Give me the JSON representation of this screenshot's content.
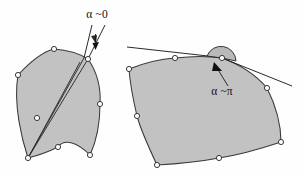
{
  "figure": {
    "background_color": "#fefefe",
    "shape_fill_color": "#c2c2c2",
    "shape_stroke_color": "#3a3a3a",
    "vertex_fill_color": "#fbfbfb",
    "vertex_stroke_color": "#313131",
    "line_color": "#1d1d1d"
  },
  "panels": [
    {
      "id": "left-panel",
      "name": "narrow-angle-region",
      "label": {
        "text": "α ~0",
        "symbol": "alpha",
        "relation": "~",
        "value": "0",
        "x": 97,
        "y": 18
      },
      "description": "Curvilinear region with a cusp-like vertex where two rays meet at a very small angle",
      "vertices": [
        {
          "x": 18,
          "y": 75
        },
        {
          "x": 54,
          "y": 49
        },
        {
          "x": 89,
          "y": 60
        },
        {
          "x": 100,
          "y": 104
        },
        {
          "x": 90,
          "y": 155
        },
        {
          "x": 58,
          "y": 147
        },
        {
          "x": 28,
          "y": 158
        },
        {
          "x": 37,
          "y": 118
        }
      ],
      "outline_path": "M 28 158 C 22 140 14 104 18 75 C 30 62 42 52 54 49 C 68 50 80 54 89 60 C 97 72 101 88 100 104 C 100 124 96 142 90 155 C 76 141 62 139 58 147 C 46 153 36 156 28 158 Z",
      "interior_chords": [
        {
          "from": {
            "x": 28,
            "y": 158
          },
          "to": {
            "x": 88,
            "y": 59
          }
        },
        {
          "from": {
            "x": 28,
            "y": 158
          },
          "to": {
            "x": 85,
            "y": 58
          }
        }
      ],
      "rays": [
        {
          "from": {
            "x": 88,
            "y": 59
          },
          "to": {
            "x": 104,
            "y": 26
          }
        },
        {
          "from": {
            "x": 85,
            "y": 58
          },
          "to": {
            "x": 92,
            "y": 26
          }
        }
      ],
      "angle_marker": {
        "type": "narrow-wedge-arrow",
        "x": 93,
        "y": 36
      }
    },
    {
      "id": "right-panel",
      "name": "straight-angle-region",
      "label": {
        "text": "α ~π",
        "symbol": "alpha",
        "relation": "~",
        "value": "π",
        "x": 222,
        "y": 92
      },
      "description": "Convex curvilinear polygon with a nearly straight (flat) angle at the top vertex",
      "vertices": [
        {
          "x": 129,
          "y": 69
        },
        {
          "x": 175,
          "y": 58
        },
        {
          "x": 222,
          "y": 58
        },
        {
          "x": 267,
          "y": 88
        },
        {
          "x": 281,
          "y": 142
        },
        {
          "x": 219,
          "y": 158
        },
        {
          "x": 157,
          "y": 165
        },
        {
          "x": 137,
          "y": 116
        }
      ],
      "outline_path": "M 129 69 C 144 63 160 59 175 58 C 192 56 208 56 222 58 C 240 64 256 75 267 88 C 276 105 281 125 281 142 C 260 149 239 155 219 158 C 198 162 176 164 157 165 C 149 148 141 131 137 116 C 133 99 130 83 129 69 Z",
      "tangent_lines": [
        {
          "from": {
            "x": 128,
            "y": 48
          },
          "to": {
            "x": 224,
            "y": 57
          }
        },
        {
          "from": {
            "x": 222,
            "y": 58
          },
          "to": {
            "x": 292,
            "y": 86
          }
        }
      ],
      "angle_marker": {
        "type": "flat-arc",
        "cx": 222,
        "cy": 58,
        "r": 15
      }
    }
  ]
}
